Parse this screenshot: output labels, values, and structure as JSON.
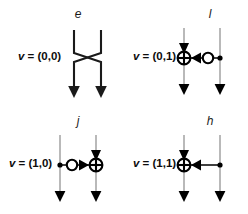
{
  "figure": {
    "background_color": "#ffffff",
    "wire_color": "#a8a8a8",
    "ink_color": "#000000",
    "panels": [
      {
        "id": "e",
        "label": "e",
        "v_prefix": "v",
        "v_equals": " = ",
        "v_value": "(0,0)",
        "v_full": "v = (0,0)",
        "diagram_type": "crossing-swap",
        "wires": 2,
        "symbols": []
      },
      {
        "id": "l",
        "label": "l",
        "v_prefix": "v",
        "v_equals": " = ",
        "v_value": "(0,1)",
        "v_full": "v = (0,1)",
        "diagram_type": "controlled-gate",
        "wires": 2,
        "symbols": [
          "crossed-circle-gate",
          "left-triangle-arrow",
          "open-circle-control",
          "filled-dot-control"
        ]
      },
      {
        "id": "j",
        "label": "j",
        "v_prefix": "v",
        "v_equals": " = ",
        "v_value": "(1,0)",
        "v_full": "v = (1,0)",
        "diagram_type": "controlled-gate",
        "wires": 2,
        "symbols": [
          "filled-dot-control",
          "open-circle-control",
          "right-triangle-arrow",
          "crossed-circle-gate"
        ]
      },
      {
        "id": "h",
        "label": "h",
        "v_prefix": "v",
        "v_equals": " = ",
        "v_value": "(1,1)",
        "v_full": "v = (1,1)",
        "diagram_type": "controlled-gate",
        "wires": 2,
        "symbols": [
          "crossed-circle-gate",
          "left-triangle-arrow",
          "filled-dot-control"
        ]
      }
    ]
  }
}
